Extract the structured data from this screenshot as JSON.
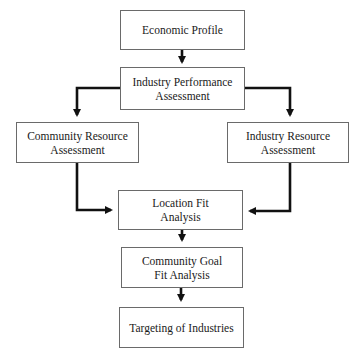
{
  "diagram": {
    "type": "flowchart",
    "nodes": [
      {
        "id": "economic_profile",
        "label": "Economic Profile"
      },
      {
        "id": "industry_performance",
        "label": "Industry Performance\nAssessment"
      },
      {
        "id": "community_resource",
        "label": "Community Resource\nAssessment"
      },
      {
        "id": "industry_resource",
        "label": "Industry Resource\nAssessment"
      },
      {
        "id": "location_fit",
        "label": "Location Fit\nAnalysis"
      },
      {
        "id": "community_goal_fit",
        "label": "Community Goal\nFit Analysis"
      },
      {
        "id": "targeting",
        "label": "Targeting of Industries"
      }
    ],
    "edges": [
      {
        "from": "economic_profile",
        "to": "industry_performance"
      },
      {
        "from": "industry_performance",
        "to": "community_resource"
      },
      {
        "from": "industry_performance",
        "to": "industry_resource"
      },
      {
        "from": "community_resource",
        "to": "location_fit"
      },
      {
        "from": "industry_resource",
        "to": "location_fit"
      },
      {
        "from": "location_fit",
        "to": "community_goal_fit"
      },
      {
        "from": "community_goal_fit",
        "to": "targeting"
      }
    ]
  },
  "colors": {
    "box_border": "#6a6a6a",
    "arrow": "#111111",
    "text": "#1a1a1a",
    "background": "#ffffff"
  }
}
